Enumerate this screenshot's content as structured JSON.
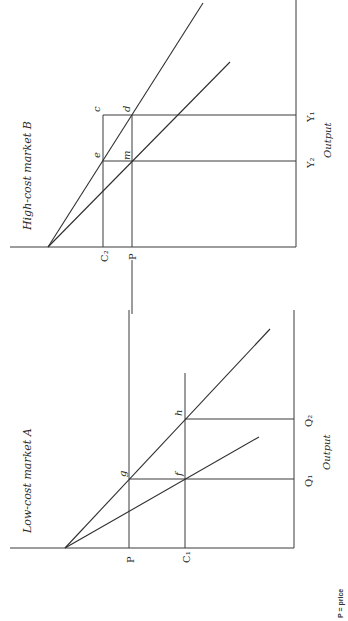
{
  "orientation": "rotated 90deg clockwise (text reads bottom-to-top)",
  "panels": {
    "market_b": {
      "title": "High-cost market B",
      "axis_label": "Output",
      "price_labels": {
        "c2": "C₂",
        "p": "P"
      },
      "output_labels": {
        "y1": "Y₁",
        "y2": "Y₂"
      },
      "points": {
        "c": "c",
        "d": "d",
        "e": "e",
        "m": "m"
      }
    },
    "market_a": {
      "title": "Low-cost market A",
      "axis_label": "Output",
      "price_labels": {
        "p": "P",
        "c1": "C₁"
      },
      "output_labels": {
        "q1": "Q₁",
        "q2": "Q₂"
      },
      "points": {
        "g": "g",
        "f": "f",
        "h": "h"
      }
    }
  },
  "legend": {
    "note": "P = price"
  },
  "colors": {
    "ink": "#2e2e2e",
    "background": "#ffffff"
  }
}
